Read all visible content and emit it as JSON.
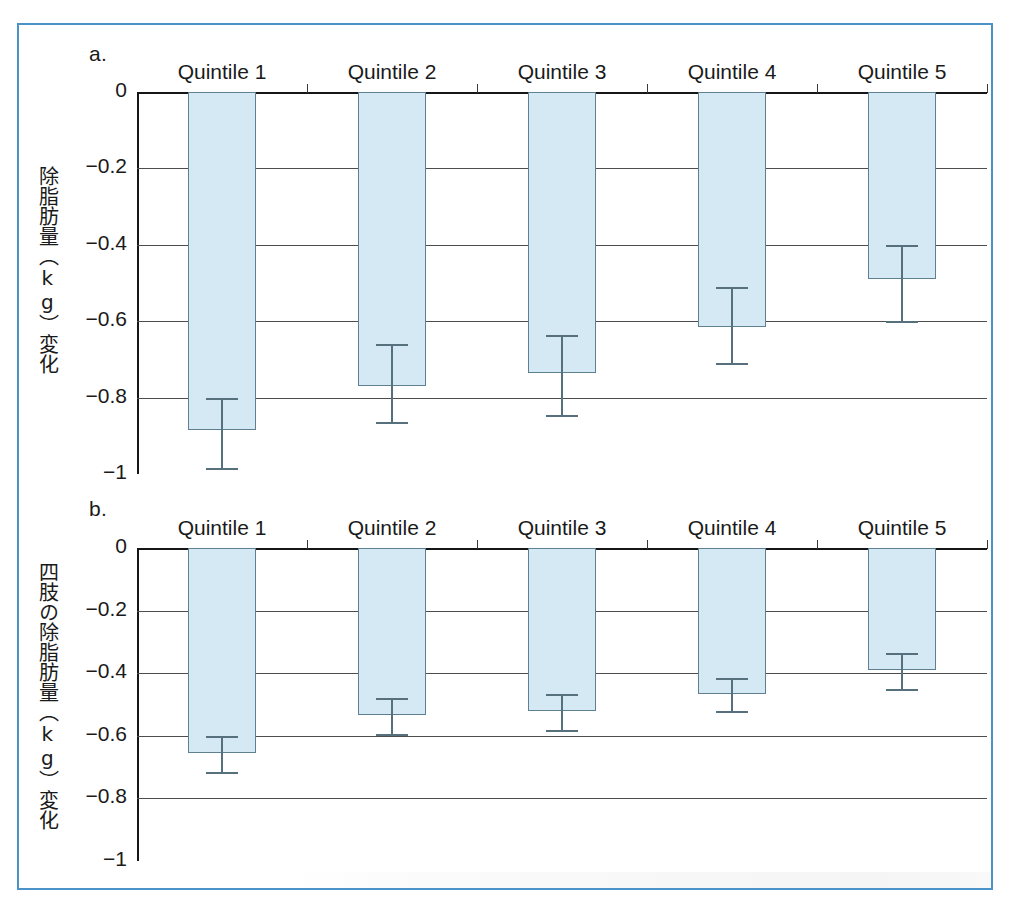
{
  "figure": {
    "border_color": "#4a93c9",
    "bar_fill_color": "#d5e9f5",
    "bar_stroke_color": "#5f7f92",
    "error_bar_color": "#56707e"
  },
  "chart_data": [
    {
      "type": "bar",
      "panel_letter": "a.",
      "title": "",
      "xlabel": "",
      "ylabel": "除脂肪量（kg）変化",
      "categories": [
        "Quintile 1",
        "Quintile 2",
        "Quintile 3",
        "Quintile 4",
        "Quintile 5"
      ],
      "values": [
        -0.885,
        -0.77,
        -0.735,
        -0.615,
        -0.49
      ],
      "error_low": [
        -0.985,
        -0.865,
        -0.845,
        -0.71,
        -0.6
      ],
      "error_high": [
        -0.8,
        -0.66,
        -0.635,
        -0.51,
        -0.4
      ],
      "ylim": [
        -1,
        0
      ],
      "yticks": [
        0,
        -0.2,
        -0.4,
        -0.6,
        -0.8,
        -1
      ],
      "ytick_labels": [
        "0",
        "−0.2",
        "−0.4",
        "−0.6",
        "−0.8",
        "−1"
      ],
      "grid": true,
      "legend": "none"
    },
    {
      "type": "bar",
      "panel_letter": "b.",
      "title": "",
      "xlabel": "",
      "ylabel": "四肢の除脂肪量（kg）変化",
      "categories": [
        "Quintile 1",
        "Quintile 2",
        "Quintile 3",
        "Quintile 4",
        "Quintile 5"
      ],
      "values": [
        -0.655,
        -0.535,
        -0.52,
        -0.465,
        -0.39
      ],
      "error_low": [
        -0.715,
        -0.595,
        -0.58,
        -0.52,
        -0.45
      ],
      "error_high": [
        -0.6,
        -0.48,
        -0.465,
        -0.415,
        -0.335
      ],
      "ylim": [
        -1,
        0
      ],
      "yticks": [
        0,
        -0.2,
        -0.4,
        -0.6,
        -0.8,
        -1
      ],
      "ytick_labels": [
        "0",
        "−0.2",
        "−0.4",
        "−0.6",
        "−0.8",
        "−1"
      ],
      "grid": true,
      "legend": "none"
    }
  ]
}
